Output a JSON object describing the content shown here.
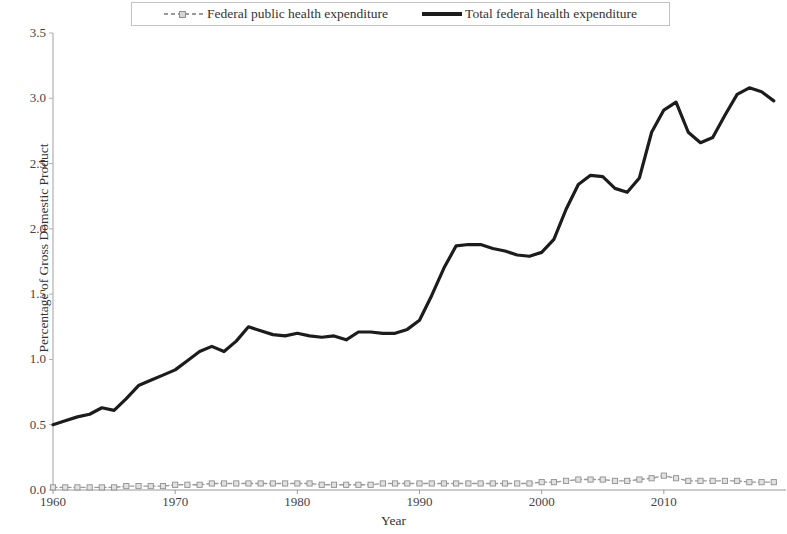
{
  "chart_data": {
    "type": "line",
    "title": "",
    "xlabel": "Year",
    "ylabel": "Percentage of Gross Domestic Product",
    "xlim": [
      1960,
      2020
    ],
    "ylim": [
      0.0,
      3.5
    ],
    "grid": false,
    "legend_position": "top-center",
    "y_ticks": [
      "0.0",
      "0.5",
      "1.0",
      "1.5",
      "2.0",
      "2.5",
      "3.0",
      "3.5"
    ],
    "y_tick_values": [
      0.0,
      0.5,
      1.0,
      1.5,
      2.0,
      2.5,
      3.0,
      3.5
    ],
    "x_ticks": [
      "1960",
      "1970",
      "1980",
      "1990",
      "2000",
      "2010"
    ],
    "x_tick_values": [
      1960,
      1970,
      1980,
      1990,
      2000,
      2010
    ],
    "x": [
      1960,
      1961,
      1962,
      1963,
      1964,
      1965,
      1966,
      1967,
      1968,
      1969,
      1970,
      1971,
      1972,
      1973,
      1974,
      1975,
      1976,
      1977,
      1978,
      1979,
      1980,
      1981,
      1982,
      1983,
      1984,
      1985,
      1986,
      1987,
      1988,
      1989,
      1990,
      1991,
      1992,
      1993,
      1994,
      1995,
      1996,
      1997,
      1998,
      1999,
      2000,
      2001,
      2002,
      2003,
      2004,
      2005,
      2006,
      2007,
      2008,
      2009,
      2010,
      2011,
      2012,
      2013,
      2014,
      2015,
      2016,
      2017,
      2018,
      2019
    ],
    "series": [
      {
        "name": "Federal public health expenditure",
        "color": "#9a9a9a",
        "marker": "square",
        "line_style": "dashed",
        "line_width": 1.4,
        "values": [
          0.02,
          0.02,
          0.02,
          0.02,
          0.02,
          0.02,
          0.03,
          0.03,
          0.03,
          0.03,
          0.04,
          0.04,
          0.04,
          0.05,
          0.05,
          0.05,
          0.05,
          0.05,
          0.05,
          0.05,
          0.05,
          0.05,
          0.04,
          0.04,
          0.04,
          0.04,
          0.04,
          0.05,
          0.05,
          0.05,
          0.05,
          0.05,
          0.05,
          0.05,
          0.05,
          0.05,
          0.05,
          0.05,
          0.05,
          0.05,
          0.06,
          0.06,
          0.07,
          0.08,
          0.08,
          0.08,
          0.07,
          0.07,
          0.08,
          0.09,
          0.11,
          0.09,
          0.07,
          0.07,
          0.07,
          0.07,
          0.07,
          0.06,
          0.06,
          0.06
        ]
      },
      {
        "name": "Total federal health expenditure",
        "color": "#1c1c1c",
        "marker": "none",
        "line_style": "solid",
        "line_width": 3.2,
        "values": [
          0.5,
          0.53,
          0.56,
          0.58,
          0.63,
          0.61,
          0.7,
          0.8,
          0.84,
          0.88,
          0.92,
          0.99,
          1.06,
          1.1,
          1.06,
          1.14,
          1.25,
          1.22,
          1.19,
          1.18,
          1.2,
          1.18,
          1.17,
          1.18,
          1.15,
          1.21,
          1.21,
          1.2,
          1.2,
          1.23,
          1.3,
          1.49,
          1.7,
          1.87,
          1.88,
          1.88,
          1.85,
          1.83,
          1.8,
          1.79,
          1.82,
          1.92,
          2.15,
          2.34,
          2.41,
          2.4,
          2.31,
          2.28,
          2.39,
          2.74,
          2.91,
          2.97,
          2.74,
          2.66,
          2.7,
          2.87,
          3.03,
          3.08,
          3.05,
          2.98
        ]
      }
    ]
  },
  "axes": {
    "y_label": "Percentage of Gross Domestic Product",
    "x_label": "Year"
  },
  "legend": {
    "items": [
      {
        "label": "Federal public health expenditure",
        "style": "series-gray"
      },
      {
        "label": "Total federal health expenditure",
        "style": "series-black"
      }
    ]
  }
}
